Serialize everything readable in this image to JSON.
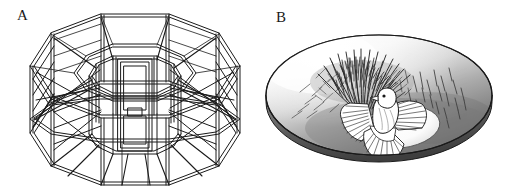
{
  "figure": {
    "width": 508,
    "height": 187,
    "background_color": "#ffffff",
    "line_color": "#1a1a1a",
    "panels": [
      {
        "id": "A",
        "label": "A",
        "subject": "octagonal aviary cage frame",
        "description": "Isometric line drawing of an eight-sided wire-frame aviary with a tiered octagonal roof, a central octagonal column containing a rectangular door panel, perimeter posts, horizontal rails and diagonal cross-braces radiating from the centre column to the outer base ring.",
        "style": "black ink line drawing, double-line struts, no fill",
        "label_position": {
          "x": 17,
          "y": 8
        }
      },
      {
        "id": "B",
        "label": "B",
        "subject": "bird in shaded nest dish with grass tuft",
        "description": "Shaded drawing of a shallow tilted oval dish. A dense dark tuft of grass blades rises from the upper-left interior, scattered short blades fan across the right. A white bird with fanned, outspread wings stands in the centre foreground beside a smooth white oval at the lower right of the dish floor.",
        "style": "graphite shading with gradient, black outline",
        "label_position": {
          "x": 276,
          "y": 10
        },
        "colors": {
          "outline": "#1a1a1a",
          "dish_light": "#ffffff",
          "dish_mid": "#c9c9c9",
          "dish_dark": "#6f6f6f",
          "rim_shadow": "#4a4a4a",
          "grass_dark": "#2a2a2a",
          "grass_light": "#6b6b6b",
          "bird_body": "#ffffff",
          "bird_outline": "#1a1a1a",
          "egg_oval": "#fdfdfd"
        }
      }
    ]
  }
}
